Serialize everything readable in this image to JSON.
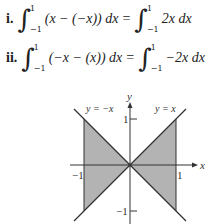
{
  "equations": [
    {
      "label": "i.",
      "lower": "−1",
      "upper": "1",
      "lhs": "(x − (−x)) dx",
      "rhs": "2x dx"
    },
    {
      "label": "ii.",
      "lower": "−1",
      "upper": "1",
      "lhs": "(−x − (x)) dx",
      "rhs": "−2x dx"
    }
  ],
  "graph": {
    "x_axis_label": "x",
    "y_axis_label": "y",
    "line1_label": "y = −x",
    "line2_label": "y = x",
    "tick_x_neg": "−1",
    "tick_x_pos": "1",
    "tick_y_pos": "1",
    "tick_y_neg": "−1",
    "shade_color": "#b3b3b3",
    "line_color": "#333333"
  }
}
